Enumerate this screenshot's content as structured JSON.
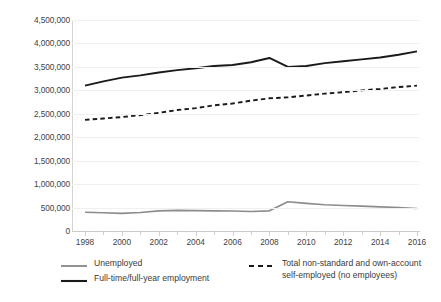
{
  "chart_data": {
    "type": "line",
    "title": "",
    "subtitle": "",
    "xlabel": "",
    "ylabel": "",
    "x": [
      1998,
      1999,
      2000,
      2001,
      2002,
      2003,
      2004,
      2005,
      2006,
      2007,
      2008,
      2009,
      2010,
      2011,
      2012,
      2013,
      2014,
      2015,
      2016
    ],
    "xlim": [
      1998,
      2016
    ],
    "ylim": [
      0,
      4500000
    ],
    "ytick_labels": [
      "0",
      "500,000",
      "1,000,000",
      "1,500,000",
      "2,000,000",
      "2,500,000",
      "3,000,000",
      "3,500,000",
      "4,000,000",
      "4,500,000"
    ],
    "ytick_values": [
      0,
      500000,
      1000000,
      1500000,
      2000000,
      2500000,
      3000000,
      3500000,
      4000000,
      4500000
    ],
    "xtick_labels": [
      "1998",
      "2000",
      "2002",
      "2004",
      "2006",
      "2008",
      "2010",
      "2012",
      "2014",
      "2016"
    ],
    "xtick_values": [
      1998,
      2000,
      2002,
      2004,
      2006,
      2008,
      2010,
      2012,
      2014,
      2016
    ],
    "grid": true,
    "legend_position": "bottom",
    "series": [
      {
        "name": "Full-time/full-year employment",
        "style": "solid",
        "color": "#1a1a1a",
        "width": 1.9,
        "values": [
          3100000,
          3190000,
          3270000,
          3320000,
          3380000,
          3430000,
          3470000,
          3520000,
          3540000,
          3600000,
          3690000,
          3500000,
          3520000,
          3580000,
          3620000,
          3660000,
          3700000,
          3760000,
          3830000
        ]
      },
      {
        "name": "Total non-standard and own-account self-employed (no employees)",
        "style": "dashed",
        "color": "#1a1a1a",
        "width": 1.9,
        "values": [
          2370000,
          2400000,
          2430000,
          2470000,
          2520000,
          2580000,
          2620000,
          2680000,
          2720000,
          2780000,
          2830000,
          2850000,
          2890000,
          2930000,
          2960000,
          3000000,
          3030000,
          3070000,
          3100000
        ]
      },
      {
        "name": "Unemployed",
        "style": "solid",
        "color": "#8c8c8c",
        "width": 1.6,
        "values": [
          400000,
          390000,
          375000,
          395000,
          430000,
          440000,
          435000,
          430000,
          425000,
          415000,
          430000,
          625000,
          590000,
          560000,
          545000,
          530000,
          515000,
          500000,
          480000
        ]
      }
    ]
  },
  "legend": {
    "items": [
      {
        "label": "Unemployed",
        "style": "solid",
        "color": "#8c8c8c"
      },
      {
        "label": "Full-time/full-year employment",
        "style": "solid",
        "color": "#1a1a1a"
      },
      {
        "label": "Total non-standard and own-account\nself-employed (no employees)",
        "style": "dashed",
        "color": "#1a1a1a"
      }
    ]
  }
}
